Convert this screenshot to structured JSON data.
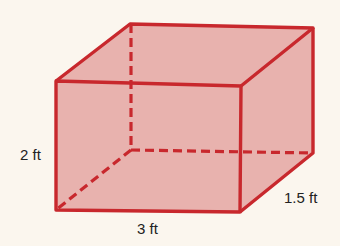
{
  "figure": {
    "type": "rectangular-prism",
    "colors": {
      "edge": "#c8282d",
      "face": "#e8b2ae",
      "background": "#fbf6ee",
      "text": "#222222"
    },
    "labels": {
      "height": "2 ft",
      "length": "3 ft",
      "width": "1.5 ft"
    }
  }
}
